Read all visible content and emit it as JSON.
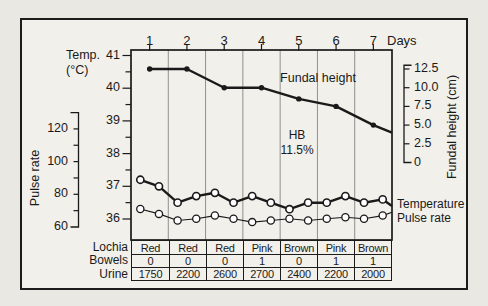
{
  "colors": {
    "ink": "#1a1a1a",
    "paper": "#eae8e2",
    "panel": "#f2f0eb",
    "grid": "#8f8f8f",
    "marker_fill": "#ffffff"
  },
  "figure": {
    "days_axis": {
      "label": "Days",
      "values": [
        "1",
        "2",
        "3",
        "4",
        "5",
        "6",
        "7"
      ]
    },
    "temp_axis": {
      "title_line1": "Temp.",
      "title_line2": "(°C)",
      "ticks": [
        "41",
        "40",
        "39",
        "38",
        "37",
        "36"
      ]
    },
    "pulse_axis": {
      "title": "Pulse rate",
      "ticks": [
        "120",
        "100",
        "80",
        "60"
      ]
    },
    "fundal_axis": {
      "title": "Fundal height (cm)",
      "ticks": [
        "12.5",
        "10.0",
        "7.5",
        "5.0",
        "2.5",
        "0"
      ]
    },
    "labels": {
      "fundal_series": "Fundal height",
      "hb_line1": "HB",
      "hb_line2": "11.5%",
      "temperature_series": "Temperature",
      "pulse_series": "Pulse rate"
    }
  },
  "chart_data": {
    "type": "line",
    "x_label": "Days",
    "x_range": [
      1,
      7
    ],
    "grid": "vertical lines at day-column boundaries",
    "axes": {
      "temp_c": {
        "side": "left",
        "range": [
          36,
          41
        ],
        "ticks": [
          36,
          37,
          38,
          39,
          40,
          41
        ],
        "minor_step": 0.5
      },
      "pulse_bpm": {
        "side": "left",
        "range": [
          60,
          130
        ],
        "ticks": [
          60,
          80,
          100,
          120
        ],
        "minor_step": 10
      },
      "fundal_cm": {
        "side": "right",
        "range": [
          0,
          12.5
        ],
        "ticks": [
          0,
          2.5,
          5,
          7.5,
          10,
          12.5
        ]
      }
    },
    "series": [
      {
        "name": "Fundal height",
        "axis": "fundal_cm",
        "unit": "cm",
        "marker": "filled-dot",
        "line": "thick",
        "per_day": 1,
        "days": [
          1,
          2,
          3,
          4,
          5,
          6,
          7
        ],
        "values": [
          12.5,
          12.5,
          10,
          10,
          8.5,
          7.5,
          5
        ],
        "edge_value": 4
      },
      {
        "name": "Temperature",
        "axis": "temp_c",
        "unit": "°C",
        "marker": "open-circle",
        "line": "thick",
        "per_day": 2,
        "values": [
          37.2,
          37.0,
          36.5,
          36.7,
          36.8,
          36.5,
          36.7,
          36.5,
          36.3,
          36.5,
          36.5,
          36.7,
          36.5,
          36.6
        ],
        "edge_value": 36.4
      },
      {
        "name": "Pulse rate",
        "axis": "pulse_bpm",
        "unit": "bpm",
        "marker": "open-circle",
        "line": "thin",
        "per_day": 2,
        "values": [
          71,
          68,
          64,
          65,
          67,
          65,
          63,
          64,
          65,
          64,
          65,
          66,
          65,
          67
        ],
        "edge_value": 69
      }
    ],
    "annotations": [
      {
        "text": "HB 11.5%",
        "position": "mid-chart, day-5 column"
      },
      {
        "text": "Fundal height",
        "position": "above fundal line, days 4-6"
      }
    ]
  },
  "table": {
    "rows": [
      {
        "label": "Lochia",
        "values": [
          "Red",
          "Red",
          "Red",
          "Pink",
          "Brown",
          "Pink",
          "Brown"
        ]
      },
      {
        "label": "Bowels",
        "values": [
          "0",
          "0",
          "0",
          "1",
          "0",
          "1",
          "1"
        ]
      },
      {
        "label": "Urine",
        "values": [
          "1750",
          "2200",
          "2600",
          "2700",
          "2400",
          "2200",
          "2000"
        ]
      }
    ]
  }
}
